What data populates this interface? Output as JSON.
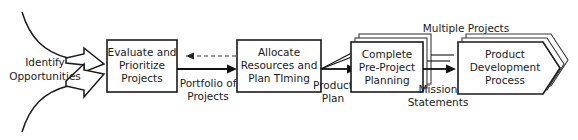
{
  "diagram": {
    "title_label": "Multiple Projects",
    "nodes": [
      {
        "id": "identify-opportunities",
        "shape": "funnel-arrows",
        "lines": [
          "Identify",
          "Opportunities"
        ]
      },
      {
        "id": "evaluate-prioritize-projects",
        "shape": "rectangle",
        "lines": [
          "Evaluate and",
          "Prioritize",
          "Projects"
        ]
      },
      {
        "id": "allocate-resources-plan-timing",
        "shape": "rectangle",
        "lines": [
          "Allocate",
          "Resources and",
          "Plan TIming"
        ]
      },
      {
        "id": "complete-pre-project-planning",
        "shape": "stacked-rectangle",
        "stack_count": 3,
        "lines": [
          "Complete",
          "Pre-Project",
          "Planning"
        ]
      },
      {
        "id": "product-development-process",
        "shape": "stacked-chevron",
        "stack_count": 3,
        "lines": [
          "Product",
          "Development",
          "Process"
        ]
      }
    ],
    "edges": [
      {
        "id": "portfolio-of-projects",
        "from": "evaluate-prioritize-projects",
        "to": "allocate-resources-plan-timing",
        "style": "solid",
        "lines": [
          "Portfolio of",
          "Projects"
        ]
      },
      {
        "id": "feedback-loop",
        "from": "allocate-resources-plan-timing",
        "to": "evaluate-prioritize-projects",
        "style": "dashed",
        "lines": []
      },
      {
        "id": "product-plan",
        "from": "allocate-resources-plan-timing",
        "to": "complete-pre-project-planning",
        "style": "solid-fan",
        "lines": [
          "Product",
          "Plan"
        ]
      },
      {
        "id": "mission-statements",
        "from": "complete-pre-project-planning",
        "to": "product-development-process",
        "style": "solid-fan",
        "lines": [
          "Mission",
          "Statements"
        ]
      }
    ],
    "colors": {
      "stroke": "#1a1a1a",
      "stack_stroke": "#3a3a3a",
      "fill": "#ffffff",
      "background": "#ffffff",
      "text": "#1a1a1a"
    }
  }
}
